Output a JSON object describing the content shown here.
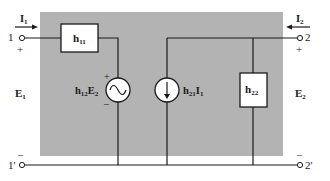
{
  "diagram": {
    "colors": {
      "background_panel": "#b3b3b3",
      "wire": "#1a1a1a",
      "component_fill": "#ffffff",
      "page": "#ffffff"
    },
    "port1": {
      "current_label": "I",
      "current_sub": "1",
      "terminal_top": "1",
      "terminal_bottom": "1'",
      "plus": "+",
      "minus": "–",
      "voltage_label": "E",
      "voltage_sub": "1"
    },
    "port2": {
      "current_label": "I",
      "current_sub": "2",
      "terminal_top": "2",
      "terminal_bottom": "2'",
      "plus": "+",
      "minus": "–",
      "voltage_label": "E",
      "voltage_sub": "2"
    },
    "components": {
      "h11": {
        "label": "h",
        "sub": "11",
        "type": "impedance"
      },
      "h12E2": {
        "label_h": "h",
        "sub_h": "12",
        "label_e": "E",
        "sub_e": "2",
        "type": "voltage-source",
        "plus": "+",
        "minus": "–"
      },
      "h21I1": {
        "label_h": "h",
        "sub_h": "21",
        "label_i": "I",
        "sub_i": "1",
        "type": "current-source"
      },
      "h22": {
        "label": "h",
        "sub": "22",
        "type": "admittance"
      }
    }
  }
}
